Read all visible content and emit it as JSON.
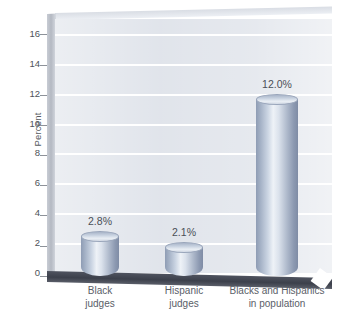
{
  "chart_data": {
    "type": "bar",
    "title": "",
    "subtitle": "",
    "xlabel": "",
    "ylabel": "Percent",
    "ylim": [
      0,
      17
    ],
    "yticks": [
      0,
      2,
      4,
      6,
      8,
      10,
      12,
      14,
      16
    ],
    "ytick_labels": [
      "0",
      "2",
      "4",
      "6",
      "8",
      "10",
      "12",
      "14",
      "16"
    ],
    "grid": true,
    "legend": "none",
    "style": "3d-cylinder",
    "categories": [
      "Black judges",
      "Hispanic judges",
      "Blacks and Hispanics in population"
    ],
    "category_lines": [
      [
        "Black",
        "judges"
      ],
      [
        "Hispanic",
        "judges"
      ],
      [
        "Blacks and Hispanics",
        "in population"
      ]
    ],
    "values": [
      2.8,
      2.1,
      12.0
    ],
    "data_labels": [
      "2.8%",
      "2.1%",
      "12.0%"
    ],
    "colors": {
      "bar_light": "#eef2f7",
      "bar_mid": "#aeb9cb",
      "bar_dark": "#7f8ca5",
      "plot_background": "#dfe3ea",
      "gridline": "#ffffff",
      "floor": "#3c404b",
      "text": "#4d5258"
    }
  }
}
